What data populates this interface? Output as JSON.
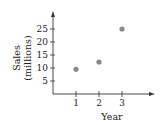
{
  "chart_data": {
    "type": "scatter",
    "title": "",
    "xlabel": "Year",
    "ylabel": "Sales (millions)",
    "ylabel_lines": [
      "Sales",
      "(millions)"
    ],
    "x": [
      1,
      2,
      3
    ],
    "values": [
      9.5,
      12.3,
      25
    ],
    "x_ticks": [
      "1",
      "2",
      "3"
    ],
    "y_ticks": [
      "5",
      "10",
      "15",
      "20",
      "25"
    ],
    "ylim": [
      0,
      30
    ],
    "xlim": [
      0,
      4
    ],
    "grid": false,
    "point_color": "#8a8a8a",
    "axis_color": "#333333"
  }
}
